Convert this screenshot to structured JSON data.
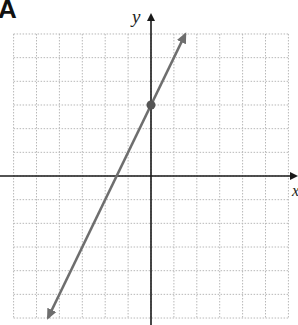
{
  "panel_label": "A",
  "axes": {
    "x_label": "x",
    "y_label": "y"
  },
  "colors": {
    "axis": "#1a1a1a",
    "grid": "#b8b8b8",
    "line": "#6e6e6e",
    "point": "#555555",
    "background": "#ffffff"
  },
  "chart_data": {
    "type": "line",
    "title": "",
    "xlabel": "x",
    "ylabel": "y",
    "xlim": [
      -6,
      6
    ],
    "ylim": [
      -6,
      6
    ],
    "grid": true,
    "grid_style": "dotted",
    "grid_step": 1,
    "tick_labels": [],
    "legend": null,
    "series": [
      {
        "name": "line",
        "equation": "y = 2x + 3",
        "slope": 2,
        "intercept": 3,
        "x": [
          -4.5,
          1.5
        ],
        "y": [
          -6,
          6
        ],
        "arrows_both_ends": true
      }
    ],
    "points": [
      {
        "label": "y-intercept",
        "x": 0,
        "y": 3
      }
    ]
  }
}
